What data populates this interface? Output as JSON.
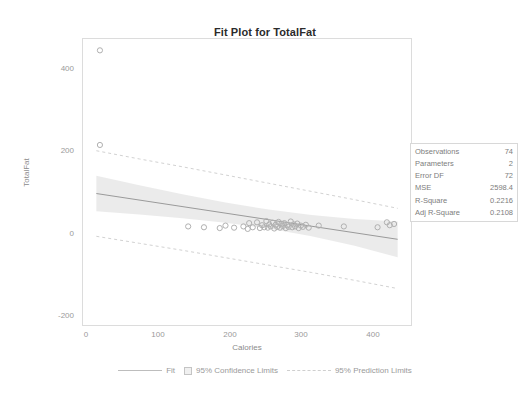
{
  "chart_data": {
    "type": "scatter",
    "title": "Fit Plot for TotalFat",
    "xlabel": "Calories",
    "ylabel": "TotalFat",
    "xlim": [
      -20,
      440
    ],
    "ylim": [
      -230,
      470
    ],
    "xticks": [
      "0",
      "100",
      "200",
      "300",
      "400"
    ],
    "xtick_values": [
      0,
      100,
      200,
      300,
      400
    ],
    "yticks": [
      "400",
      "200",
      "0",
      "-200"
    ],
    "ytick_values": [
      400,
      200,
      0,
      -200
    ],
    "grid": false,
    "legend_position": "bottom",
    "fit_line": {
      "label": "Fit",
      "slope": -0.265,
      "intercept": 92.0,
      "x_start": 0,
      "x_end": 420,
      "y_start": 92.0,
      "y_end": -19.3
    },
    "confidence_band": {
      "label": "95% Confidence Limits",
      "level": 95,
      "x": [
        0,
        60,
        120,
        180,
        240,
        300,
        360,
        420
      ],
      "upper": [
        135,
        112,
        90,
        70,
        53,
        40,
        30,
        24
      ],
      "lower": [
        49,
        41,
        32,
        21,
        7,
        -12,
        -35,
        -63
      ]
    },
    "prediction_band": {
      "label": "95% Prediction Limits",
      "level": 95,
      "x": [
        0,
        60,
        120,
        180,
        240,
        300,
        360,
        420
      ],
      "upper": [
        196,
        176,
        157,
        137,
        117,
        97,
        77,
        56
      ],
      "lower": [
        -12,
        -29,
        -46,
        -64,
        -82,
        -100,
        -119,
        -139
      ]
    },
    "points": [
      [
        5,
        440
      ],
      [
        5,
        210
      ],
      [
        128,
        12
      ],
      [
        150,
        10
      ],
      [
        172,
        8
      ],
      [
        180,
        14
      ],
      [
        192,
        9
      ],
      [
        205,
        12
      ],
      [
        211,
        6
      ],
      [
        213,
        20
      ],
      [
        218,
        10
      ],
      [
        224,
        22
      ],
      [
        228,
        8
      ],
      [
        231,
        15
      ],
      [
        234,
        10
      ],
      [
        237,
        25
      ],
      [
        239,
        9
      ],
      [
        241,
        17
      ],
      [
        243,
        12
      ],
      [
        246,
        21
      ],
      [
        248,
        7
      ],
      [
        250,
        16
      ],
      [
        252,
        11
      ],
      [
        254,
        23
      ],
      [
        256,
        9
      ],
      [
        258,
        18
      ],
      [
        260,
        13
      ],
      [
        262,
        20
      ],
      [
        264,
        8
      ],
      [
        266,
        15
      ],
      [
        268,
        11
      ],
      [
        271,
        24
      ],
      [
        273,
        10
      ],
      [
        275,
        17
      ],
      [
        277,
        12
      ],
      [
        280,
        19
      ],
      [
        282,
        8
      ],
      [
        285,
        14
      ],
      [
        288,
        11
      ],
      [
        292,
        16
      ],
      [
        296,
        9
      ],
      [
        310,
        14
      ],
      [
        345,
        12
      ],
      [
        392,
        10
      ],
      [
        405,
        22
      ],
      [
        409,
        15
      ],
      [
        415,
        18
      ]
    ]
  },
  "stats": {
    "rows": [
      {
        "label": "Observations",
        "value": "74"
      },
      {
        "label": "Parameters",
        "value": "2"
      },
      {
        "label": "Error DF",
        "value": "72"
      },
      {
        "label": "MSE",
        "value": "2598.4"
      },
      {
        "label": "R-Square",
        "value": "0.2216"
      },
      {
        "label": "Adj R-Square",
        "value": "0.2108"
      }
    ]
  },
  "colors": {
    "fit_line": "#9a9a9a",
    "confidence_fill": "#e8e8e8",
    "prediction_line": "#d2d2d2",
    "marker_stroke": "#b0b0b0",
    "axis": "#d5d5d5",
    "text": "#9a9a9a",
    "title": "#2b2b2b"
  }
}
